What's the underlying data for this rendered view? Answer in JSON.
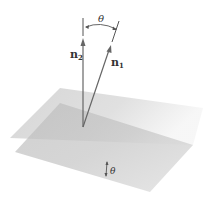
{
  "diagram": {
    "labels": {
      "normal_2": "n",
      "normal_2_sub": "2",
      "normal_1": "n",
      "normal_1_sub": "1",
      "angle_top": "θ",
      "angle_bottom": "θ"
    },
    "colors": {
      "plane_1": "#bdbdbd",
      "plane_2": "#9e9e9e",
      "vector": "#666666",
      "text": "#333333"
    }
  }
}
